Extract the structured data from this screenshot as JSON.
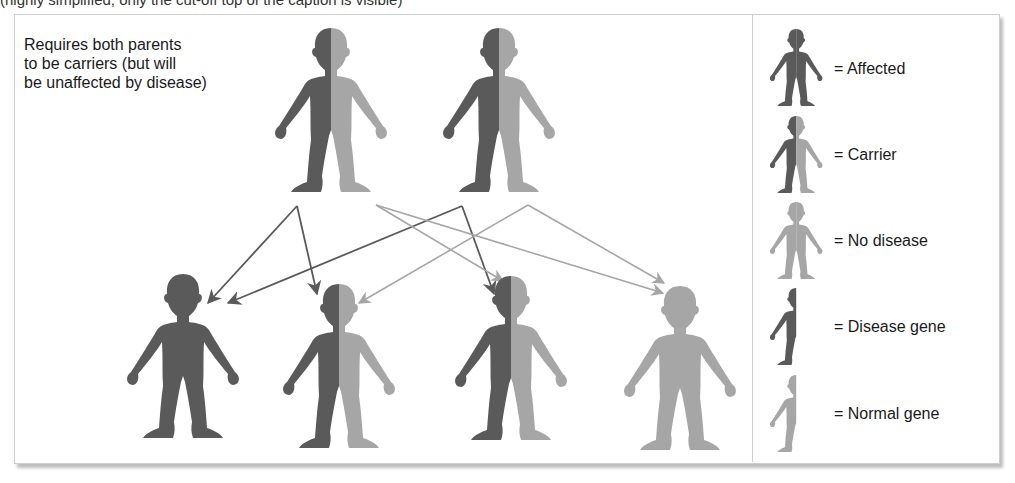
{
  "header": {
    "partial_title": "(highly simplified; only the cut-off top of the caption is visible)"
  },
  "description": {
    "lines": [
      "Requires both parents",
      "to be carriers (but will",
      "be unaffected by disease)"
    ]
  },
  "colors": {
    "disease_gene": "#5a5a5a",
    "normal_gene": "#a6a6a6",
    "border": "#cfcfcf",
    "shadow": "#bdbdbd",
    "text": "#1a1a1a"
  },
  "parents": [
    {
      "id": "parent-1",
      "status": "Carrier"
    },
    {
      "id": "parent-2",
      "status": "Carrier"
    }
  ],
  "children": [
    {
      "id": "child-1",
      "status": "Affected"
    },
    {
      "id": "child-2",
      "status": "Carrier"
    },
    {
      "id": "child-3",
      "status": "Carrier"
    },
    {
      "id": "child-4",
      "status": "No disease"
    }
  ],
  "inheritance_arrows": [
    {
      "from": "parent-1 disease gene",
      "to": "child-1",
      "color": "dark"
    },
    {
      "from": "parent-1 disease gene",
      "to": "child-2",
      "color": "dark"
    },
    {
      "from": "parent-2 disease gene",
      "to": "child-1",
      "color": "dark"
    },
    {
      "from": "parent-2 disease gene",
      "to": "child-3",
      "color": "dark"
    },
    {
      "from": "parent-1 normal gene",
      "to": "child-3",
      "color": "light"
    },
    {
      "from": "parent-1 normal gene",
      "to": "child-4",
      "color": "light"
    },
    {
      "from": "parent-2 normal gene",
      "to": "child-2",
      "color": "light"
    },
    {
      "from": "parent-2 normal gene",
      "to": "child-4",
      "color": "light"
    }
  ],
  "legend": {
    "items": [
      {
        "icon": "affected-figure-icon",
        "label": "= Affected"
      },
      {
        "icon": "carrier-figure-icon",
        "label": "= Carrier"
      },
      {
        "icon": "no-disease-figure-icon",
        "label": "= No disease"
      },
      {
        "icon": "disease-gene-half-figure-icon",
        "label": "= Disease gene"
      },
      {
        "icon": "normal-gene-half-figure-icon",
        "label": "= Normal gene"
      }
    ]
  }
}
